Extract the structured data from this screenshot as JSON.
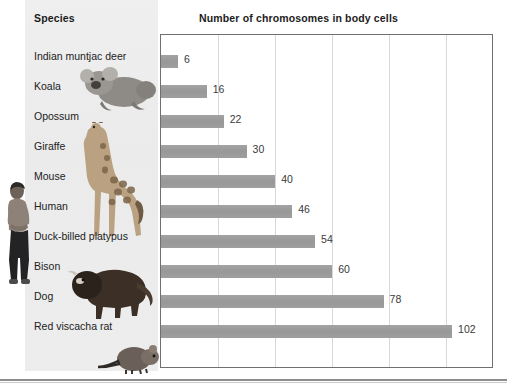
{
  "headers": {
    "species": "Species",
    "chart": "Number of chromosomes in body cells"
  },
  "colors": {
    "bar": "#9b9b9b",
    "panel": "#eeeeee",
    "grid": "#d8d8d8",
    "frame": "#6f6f6f",
    "text": "#222222"
  },
  "chart_data": {
    "type": "bar",
    "orientation": "horizontal",
    "title": "Number of chromosomes in body cells",
    "xlabel": "",
    "ylabel": "Species",
    "categories": [
      "Indian muntjac deer",
      "Koala",
      "Opossum",
      "Giraffe",
      "Mouse",
      "Human",
      "Duck-billed platypus",
      "Bison",
      "Dog",
      "Red viscacha rat"
    ],
    "values": [
      6,
      16,
      22,
      30,
      40,
      46,
      54,
      60,
      78,
      102
    ],
    "value_labels": [
      "6",
      "16",
      "22",
      "30",
      "40",
      "46",
      "54",
      "60",
      "78",
      "102"
    ],
    "xlim": [
      0,
      116
    ],
    "gridlines": [
      20,
      40,
      60,
      80,
      100
    ],
    "grid": true,
    "legend": "none"
  },
  "artwork": [
    {
      "name": "human-figure-illustration"
    },
    {
      "name": "koala-illustration"
    },
    {
      "name": "giraffe-illustration"
    },
    {
      "name": "bison-illustration"
    },
    {
      "name": "viscacha-rat-illustration"
    }
  ]
}
